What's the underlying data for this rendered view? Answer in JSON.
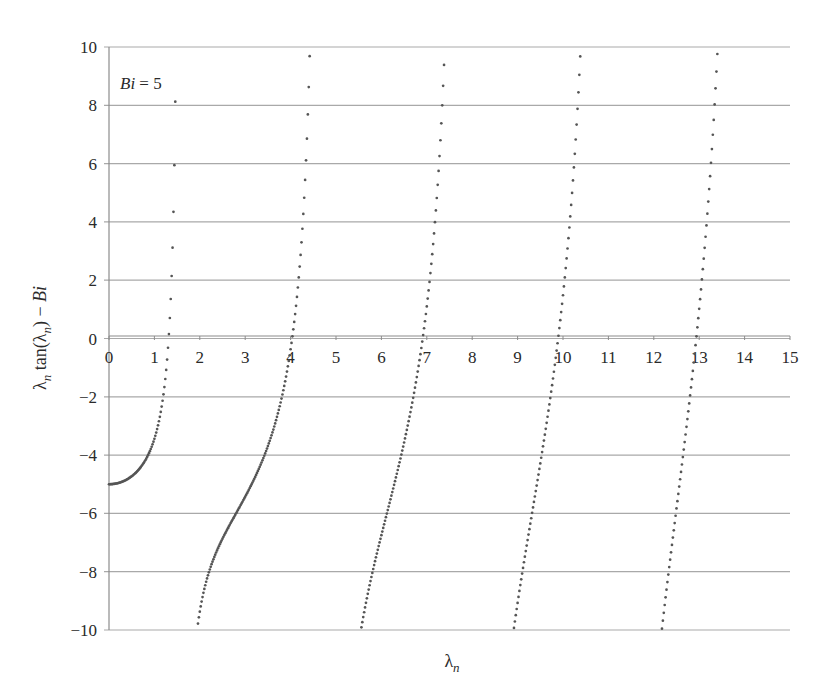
{
  "chart_data": {
    "type": "scatter",
    "title": "",
    "function": "lambda_n * tan(lambda_n) - Bi",
    "parameter": {
      "name": "Bi",
      "value": 5
    },
    "annotation": {
      "text_var": "Bi",
      "text_eq": " = 5"
    },
    "xlabel": {
      "symbol": "λ",
      "sub": "n"
    },
    "ylabel": {
      "prefix": "λ",
      "sub1": "n",
      "mid": " tan(λ",
      "sub2": "n",
      "suffix": ") − ",
      "var": "Bi"
    },
    "xlim": [
      0,
      15
    ],
    "ylim": [
      -10,
      10
    ],
    "x_ticks": [
      0,
      1,
      2,
      3,
      4,
      5,
      6,
      7,
      8,
      9,
      10,
      11,
      12,
      13,
      14,
      15
    ],
    "y_ticks": [
      10,
      8,
      6,
      4,
      2,
      0,
      -2,
      -4,
      -6,
      -8,
      -10
    ],
    "y_tick_labels": [
      "10",
      "8",
      "6",
      "4",
      "2",
      "0",
      "−2",
      "−4",
      "−6",
      "−8",
      "−10"
    ],
    "grid": {
      "horizontal": true,
      "vertical": false
    },
    "sample_step": 0.0025,
    "series": [
      {
        "name": "branch-1",
        "x_range": [
          0.0,
          1.42
        ],
        "approx_points": [
          [
            0,
            -5
          ],
          [
            0.5,
            -4.73
          ],
          [
            1.0,
            -3.44
          ],
          [
            1.2,
            -1.93
          ],
          [
            1.3135,
            0
          ],
          [
            1.4,
            3.1
          ]
        ]
      },
      {
        "name": "branch-2",
        "x_range": [
          1.96,
          4.55
        ],
        "approx_points": [
          [
            2.0,
            -9.37
          ],
          [
            2.5,
            -6.87
          ],
          [
            3.0,
            -5.43
          ],
          [
            3.5,
            -3.71
          ],
          [
            4.0,
            -0.37
          ],
          [
            4.0336,
            0
          ],
          [
            4.4,
            8.0
          ]
        ]
      },
      {
        "name": "branch-3",
        "x_range": [
          5.6,
          7.7
        ],
        "approx_points": [
          [
            5.6,
            -9.5
          ],
          [
            6.0,
            -6.74
          ],
          [
            6.5,
            -3.58
          ],
          [
            6.9099,
            0
          ],
          [
            7.2,
            3.8
          ]
        ]
      },
      {
        "name": "branch-4",
        "x_range": [
          8.9,
          10.9
        ],
        "approx_points": [
          [
            9.0,
            -9.1
          ],
          [
            9.5,
            -5.9
          ],
          [
            9.8928,
            0
          ],
          [
            10.2,
            6.5
          ]
        ]
      },
      {
        "name": "branch-5",
        "x_range": [
          12.1,
          13.9
        ],
        "approx_points": [
          [
            12.2,
            -9.2
          ],
          [
            12.6,
            -4.4
          ],
          [
            13.0683,
            0
          ],
          [
            13.4,
            9.0
          ]
        ]
      }
    ],
    "roots_visible": [
      1.3138,
      4.0336,
      6.9096,
      9.8928,
      13.0683
    ]
  },
  "colors": {
    "grid": "#a9a9a9",
    "axis": "#8c8c8c",
    "curve": "#555555",
    "text": "#2a2a2a"
  }
}
